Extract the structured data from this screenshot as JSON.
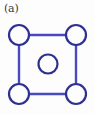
{
  "panel": {
    "label": "(a)",
    "background_color": "#fdfdfd",
    "width": 95,
    "height": 115
  },
  "diagram": {
    "type": "lattice-unit-cell",
    "bond_color": "#4a4ac0",
    "bond_width": 2.4,
    "node_stroke_color": "#2f2f8f",
    "node_stroke_width": 2.2,
    "node_fill_color": "#fdfdfd",
    "square": {
      "left": 19,
      "top": 35,
      "right": 76,
      "bottom": 94,
      "side": 57
    },
    "nodes": [
      {
        "name": "corner-top-left",
        "cx": 19,
        "cy": 35,
        "r": 10
      },
      {
        "name": "corner-top-right",
        "cx": 76,
        "cy": 35,
        "r": 10
      },
      {
        "name": "corner-bottom-left",
        "cx": 19,
        "cy": 94,
        "r": 10
      },
      {
        "name": "corner-bottom-right",
        "cx": 76,
        "cy": 94,
        "r": 10
      },
      {
        "name": "center-site",
        "cx": 48,
        "cy": 64,
        "r": 9.5
      }
    ],
    "bonds": [
      {
        "name": "bond-top",
        "x1": 19,
        "y1": 35,
        "x2": 76,
        "y2": 35
      },
      {
        "name": "bond-bottom",
        "x1": 19,
        "y1": 94,
        "x2": 76,
        "y2": 94
      },
      {
        "name": "bond-left",
        "x1": 19,
        "y1": 35,
        "x2": 19,
        "y2": 94
      },
      {
        "name": "bond-right",
        "x1": 76,
        "y1": 35,
        "x2": 76,
        "y2": 94
      }
    ]
  }
}
